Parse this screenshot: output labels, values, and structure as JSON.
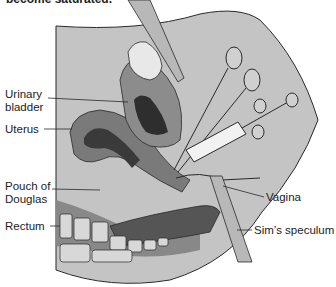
{
  "header": {
    "caption_fragment": "become saturated."
  },
  "labels": {
    "urinary_bladder_line1": "Urinary",
    "urinary_bladder_line2": "bladder",
    "uterus": "Uterus",
    "pouch_of_douglas_line1": "Pouch of",
    "pouch_of_douglas_line2": "Douglas",
    "rectum": "Rectum",
    "vagina": "Vagina",
    "sims_speculum": "Sim’s speculum"
  },
  "colors": {
    "body_fill": "#c4c4c4",
    "outline": "#2a2a2a",
    "bladder": "#e8e8e8",
    "uterus_dark": "#3a3a3a",
    "uterus_mid": "#7a7a7a",
    "rectum_dark": "#555555",
    "instrument_fill": "#b8b8b8",
    "syringe_barrel": "#f2f2f2"
  }
}
